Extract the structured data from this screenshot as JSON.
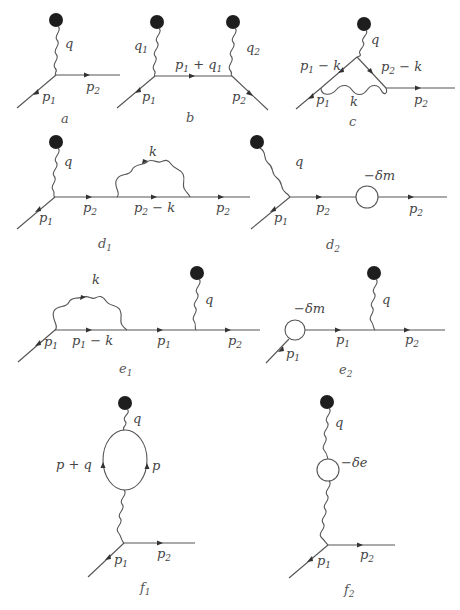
{
  "figure": {
    "colors": {
      "line": "#555555",
      "blob": "#1e1e1e",
      "label": "#444444"
    }
  },
  "diagrams": {
    "a": {
      "caption": "a",
      "caption_sub": "",
      "labels": {
        "q": "q",
        "p1": "p",
        "p1_sub": "1",
        "p2": "p",
        "p2_sub": "2"
      }
    },
    "b": {
      "caption": "b",
      "caption_sub": "",
      "labels": {
        "q1": "q",
        "q1_sub": "1",
        "q2": "q",
        "q2_sub": "2",
        "p1q1": "p",
        "p1q1_sub": "1",
        "p1q1_tail": " + q",
        "p1q1_tail_sub": "1",
        "p1": "p",
        "p1_sub": "1",
        "p2": "p",
        "p2_sub": "2"
      }
    },
    "c": {
      "caption": "c",
      "caption_sub": "",
      "labels": {
        "q": "q",
        "p1k": "p",
        "p1k_sub": "1",
        "p1k_tail": " − k",
        "p2k": "p",
        "p2k_sub": "2",
        "p2k_tail": " − k",
        "p1": "p",
        "p1_sub": "1",
        "k": "k",
        "p2": "p",
        "p2_sub": "2"
      }
    },
    "d1": {
      "caption": "d",
      "caption_sub": "1",
      "labels": {
        "q": "q",
        "k": "k",
        "p1": "p",
        "p1_sub": "1",
        "p2a": "p",
        "p2a_sub": "2",
        "p2k": "p",
        "p2k_sub": "2",
        "p2k_tail": " − k",
        "p2b": "p",
        "p2b_sub": "2"
      }
    },
    "d2": {
      "caption": "d",
      "caption_sub": "2",
      "labels": {
        "q": "q",
        "dm": "−δm",
        "p1": "p",
        "p1_sub": "1",
        "p2a": "p",
        "p2a_sub": "2",
        "p2b": "p",
        "p2b_sub": "2"
      }
    },
    "e1": {
      "caption": "e",
      "caption_sub": "1",
      "labels": {
        "k": "k",
        "q": "q",
        "p1": "p",
        "p1_sub": "1",
        "p1k": "p",
        "p1k_sub": "1",
        "p1k_tail": " − k",
        "p1b": "p",
        "p1b_sub": "1",
        "p2": "p",
        "p2_sub": "2"
      }
    },
    "e2": {
      "caption": "e",
      "caption_sub": "2",
      "labels": {
        "dm": "−δm",
        "q": "q",
        "p1": "p",
        "p1_sub": "1",
        "p1b": "p",
        "p1b_sub": "1",
        "p2": "p",
        "p2_sub": "2"
      }
    },
    "f1": {
      "caption": "f",
      "caption_sub": "1",
      "labels": {
        "q": "q",
        "pq": "p + q",
        "p": "p",
        "p1": "p",
        "p1_sub": "1",
        "p2": "p",
        "p2_sub": "2"
      }
    },
    "f2": {
      "caption": "f",
      "caption_sub": "2",
      "labels": {
        "q": "q",
        "de": "−δe",
        "p1": "p",
        "p1_sub": "1",
        "p2": "p",
        "p2_sub": "2"
      }
    }
  }
}
